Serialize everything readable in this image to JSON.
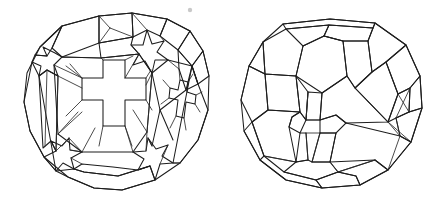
{
  "plate": {
    "background_color": "#ffffff",
    "ink_color": "#1d1d1d",
    "width": 444,
    "height": 205,
    "figure_count": 2,
    "title": "",
    "caption": ""
  },
  "figures": [
    {
      "id": "left-polyhedron",
      "name": "stellated-truncated-polyhedron-left",
      "label": "",
      "description": "Line drawing of a near-spherical polyhedron with recessed cross-shaped (Greek cross) faces and raised star-shaped vertices",
      "center_x": 116,
      "center_y": 104,
      "radius": 95,
      "stroke_color": "#1d1d1d",
      "stroke_width": 1.05,
      "fill": "none"
    },
    {
      "id": "right-polyhedron",
      "name": "truncated-polyhedron-right",
      "label": "",
      "description": "Line drawing of a faceted convex polyhedron with hexagonal and pentagonal faces and a small pinched facet cluster at the right",
      "center_x": 330,
      "center_y": 104,
      "radius": 92,
      "stroke_color": "#1d1d1d",
      "stroke_width": 1.05,
      "fill": "none"
    }
  ],
  "marks": [
    {
      "id": "speck",
      "name": "stray-speck-mark",
      "x": 190,
      "y": 10,
      "color": "#c9c9c9",
      "label": ""
    }
  ]
}
